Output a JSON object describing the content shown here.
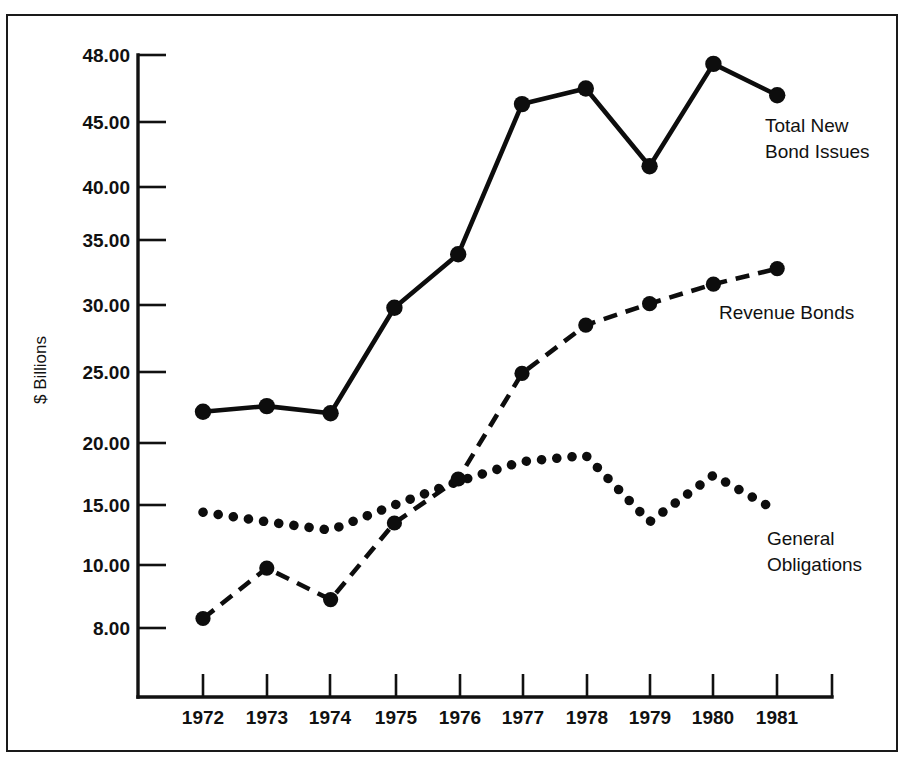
{
  "chart_data": {
    "type": "line",
    "title": "",
    "xlabel": "",
    "ylabel": "$ Billions",
    "x": [
      "1972",
      "1973",
      "1974",
      "1975",
      "1976",
      "1977",
      "1978",
      "1979",
      "1980",
      "1981"
    ],
    "categories": [
      "1972",
      "1973",
      "1974",
      "1975",
      "1976",
      "1977",
      "1978",
      "1979",
      "1980",
      "1981"
    ],
    "yticks": [
      "8.00",
      "10.00",
      "15.00",
      "20.00",
      "25.00",
      "30.00",
      "35.00",
      "40.00",
      "45.00",
      "48.00"
    ],
    "ytick_values": [
      8,
      10,
      15,
      20,
      25,
      30,
      35,
      40,
      45,
      48
    ],
    "ylim": [
      7.6,
      48.6
    ],
    "grid": false,
    "legend_position": "inline-annotations",
    "scale_note": "non-linear (compressed) vertical scale",
    "series": [
      {
        "name": "Total New Bond Issues",
        "style": "solid",
        "values": [
          22.2,
          22.6,
          22.1,
          29.8,
          33.9,
          45.8,
          46.5,
          41.6,
          47.6,
          46.2
        ]
      },
      {
        "name": "Revenue Bonds",
        "style": "dashed",
        "values": [
          8.3,
          9.9,
          8.9,
          13.5,
          17.1,
          24.9,
          28.5,
          30.1,
          31.6,
          32.8
        ]
      },
      {
        "name": "General Obligations",
        "style": "dotted",
        "values": [
          14.4,
          13.6,
          12.9,
          15.0,
          16.9,
          18.5,
          19.0,
          13.6,
          17.4,
          14.5
        ]
      }
    ],
    "annotations": [
      {
        "text_line1": "Total New",
        "text_line2": "Bond Issues",
        "series": "Total New Bond Issues"
      },
      {
        "text_line1": "Revenue Bonds",
        "text_line2": "",
        "series": "Revenue Bonds"
      },
      {
        "text_line1": "General",
        "text_line2": "Obligations",
        "series": "General Obligations"
      }
    ],
    "colors": {
      "ink": "#0d0d0d",
      "background": "#ffffff",
      "frame": "#1a1a1a"
    }
  },
  "axis": {
    "y_title": "$ Billions",
    "y_ticks": [
      "48.00",
      "45.00",
      "40.00",
      "35.00",
      "30.00",
      "25.00",
      "20.00",
      "15.00",
      "10.00",
      "8.00"
    ],
    "x_ticks": [
      "1972",
      "1973",
      "1974",
      "1975",
      "1976",
      "1977",
      "1978",
      "1979",
      "1980",
      "1981"
    ]
  },
  "labels": {
    "total_line1": "Total New",
    "total_line2": "Bond Issues",
    "revenue": "Revenue Bonds",
    "general_line1": "General",
    "general_line2": "Obligations"
  }
}
